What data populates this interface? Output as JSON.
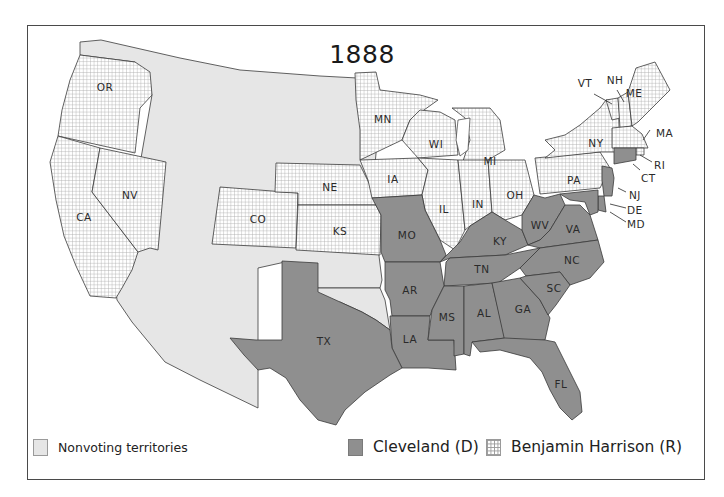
{
  "map": {
    "title": "1888",
    "colors": {
      "nonvoting": "#e6e6e6",
      "democrat": "#8f8f8f",
      "republican_pattern": "grid-hatch",
      "border": "#4a4a4a"
    },
    "legend": {
      "nonvoting": "Nonvoting territories",
      "democrat": "Cleveland (D)",
      "republican": "Benjamin Harrison (R)"
    },
    "states": {
      "OR": "OR",
      "CA": "CA",
      "NV": "NV",
      "CO": "CO",
      "NE": "NE",
      "KS": "KS",
      "MN": "MN",
      "IA": "IA",
      "WI": "WI",
      "MI": "MI",
      "IL": "IL",
      "IN": "IN",
      "OH": "OH",
      "PA": "PA",
      "NY": "NY",
      "VT": "VT",
      "NH": "NH",
      "ME": "ME",
      "MA": "MA",
      "RI": "RI",
      "CT": "CT",
      "NJ": "NJ",
      "DE": "DE",
      "MD": "MD",
      "MO": "MO",
      "KY": "KY",
      "WV": "WV",
      "VA": "VA",
      "NC": "NC",
      "TN": "TN",
      "AR": "AR",
      "TX": "TX",
      "LA": "LA",
      "MS": "MS",
      "AL": "AL",
      "GA": "GA",
      "SC": "SC",
      "FL": "FL"
    },
    "results": {
      "Cleveland (D)": [
        "CT",
        "NJ",
        "DE",
        "MD",
        "MO",
        "KY",
        "WV",
        "VA",
        "NC",
        "TN",
        "AR",
        "TX",
        "LA",
        "MS",
        "AL",
        "GA",
        "SC",
        "FL"
      ],
      "Benjamin Harrison (R)": [
        "OR",
        "CA",
        "NV",
        "CO",
        "NE",
        "KS",
        "MN",
        "IA",
        "WI",
        "MI",
        "IL",
        "IN",
        "OH",
        "PA",
        "NY",
        "VT",
        "NH",
        "ME",
        "MA",
        "RI"
      ],
      "Nonvoting territories": [
        "Washington",
        "Idaho",
        "Montana",
        "Wyoming",
        "Dakota",
        "Utah",
        "Arizona",
        "New Mexico",
        "Indian Territory"
      ]
    }
  }
}
